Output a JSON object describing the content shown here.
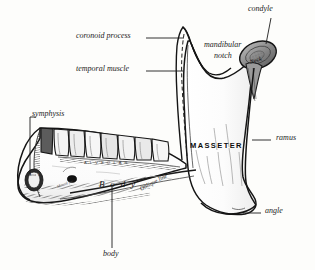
{
  "figure": {
    "style": "engraving",
    "ink_color": "#1a1a1a",
    "paper_color": "#fdfdfb"
  },
  "labels": {
    "condyle": "condyle",
    "mandibular_notch_line1": "mandibular",
    "mandibular_notch_line2": "notch",
    "coronoid_process": "coronoid process",
    "temporal_muscle": "temporal muscle",
    "ramus": "ramus",
    "angle": "angle",
    "symphysis": "symphysis",
    "body_leader": "body",
    "body_inner": "B o d y",
    "masseter": "MASSETER",
    "oblique_line": "Oblique line",
    "neck": "Neck",
    "alveolar_band": "A L V E O L A R",
    "mental_foramen": "Mental for.",
    "mental_tubercle_line1": "MEN",
    "mental_tubercle_line2": "TAL",
    "mental_tubercle_line3": "TUB"
  }
}
